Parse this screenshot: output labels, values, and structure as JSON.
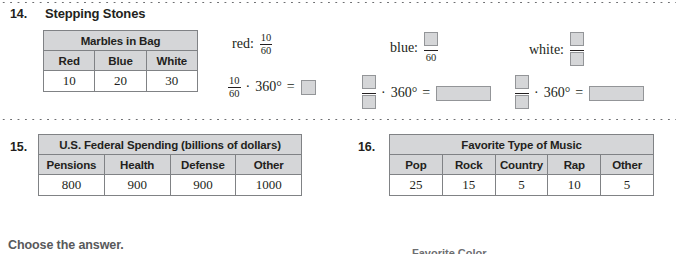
{
  "separators": {
    "top": "dotted-rule",
    "middle": "dotted-rule"
  },
  "problem14": {
    "number": "14.",
    "title": "Stepping Stones",
    "table": {
      "caption": "Marbles in Bag",
      "columns": [
        "Red",
        "Blue",
        "White"
      ],
      "values": [
        "10",
        "20",
        "30"
      ]
    },
    "expressions": [
      {
        "label": "red:",
        "numerator": "10",
        "denominator": "60",
        "numerator_blank": false,
        "denominator_blank": false
      },
      {
        "label": "blue:",
        "numerator": "",
        "denominator": "60",
        "numerator_blank": true,
        "denominator_blank": false
      },
      {
        "label": "white:",
        "numerator": "",
        "denominator": "",
        "numerator_blank": true,
        "denominator_blank": true
      }
    ],
    "equations": [
      {
        "numerator": "10",
        "denominator": "60",
        "numerator_blank": false,
        "denominator_blank": false,
        "operator": "·",
        "multiplier": "360°",
        "equals": "=",
        "answer_blank": "square"
      },
      {
        "numerator": "",
        "denominator": "",
        "numerator_blank": true,
        "denominator_blank": true,
        "operator": "·",
        "multiplier": "360°",
        "equals": "=",
        "answer_blank": "wide"
      },
      {
        "numerator": "",
        "denominator": "",
        "numerator_blank": true,
        "denominator_blank": true,
        "operator": "·",
        "multiplier": "360°",
        "equals": "=",
        "answer_blank": "wide"
      }
    ]
  },
  "problem15": {
    "number": "15.",
    "table": {
      "caption": "U.S. Federal Spending (billions of dollars)",
      "columns": [
        "Pensions",
        "Health",
        "Defense",
        "Other"
      ],
      "values": [
        "800",
        "900",
        "900",
        "1000"
      ]
    }
  },
  "problem16": {
    "number": "16.",
    "table": {
      "caption": "Favorite Type of Music",
      "columns": [
        "Pop",
        "Rock",
        "Country",
        "Rap",
        "Other"
      ],
      "values": [
        "25",
        "15",
        "5",
        "10",
        "5"
      ]
    }
  },
  "footer": {
    "instruction": "Choose the answer.",
    "clipped_caption": "Favorite Color"
  },
  "colors": {
    "header_fill": "#d5d6d8",
    "blank_fill": "#d5d6d8",
    "border": "#808285",
    "text": "#231f20",
    "footer_text": "#58595b"
  }
}
